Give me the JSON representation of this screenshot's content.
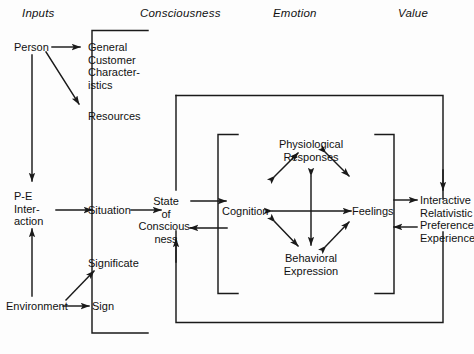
{
  "diagram": {
    "background_color": "#fdfdfd",
    "line_color": "#1a1a1a",
    "text_color": "#111111"
  },
  "columns": [
    {
      "id": "inputs",
      "label": "Inputs"
    },
    {
      "id": "consciousness",
      "label": "Consciousness"
    },
    {
      "id": "emotion",
      "label": "Emotion"
    },
    {
      "id": "value",
      "label": "Value"
    }
  ],
  "nodes": [
    {
      "id": "person",
      "label": "Person",
      "column": "inputs"
    },
    {
      "id": "general-customer-characteristics",
      "label": "General\nCustomer\nCharacter-\nistics",
      "column": "inputs"
    },
    {
      "id": "resources",
      "label": "Resources",
      "column": "inputs"
    },
    {
      "id": "pe-interaction",
      "label": "P-E\nInter-\naction",
      "column": "inputs"
    },
    {
      "id": "situation",
      "label": "Situation",
      "column": "inputs"
    },
    {
      "id": "significate",
      "label": "Significate",
      "column": "inputs"
    },
    {
      "id": "environment",
      "label": "Environment",
      "column": "inputs"
    },
    {
      "id": "sign",
      "label": "Sign",
      "column": "inputs"
    },
    {
      "id": "state-of-consciousness",
      "label": "State\nof\nConscious-\nness",
      "column": "consciousness"
    },
    {
      "id": "cognition",
      "label": "Cognition",
      "column": "emotion"
    },
    {
      "id": "physiological-responses",
      "label": "Physiological\nResponses",
      "column": "emotion"
    },
    {
      "id": "behavioral-expression",
      "label": "Behavioral\nExpression",
      "column": "emotion"
    },
    {
      "id": "feelings",
      "label": "Feelings",
      "column": "emotion"
    },
    {
      "id": "interactive-relativistic-preference-experience",
      "label": "Interactive\nRelativistic\nPreference\nExperience",
      "column": "value"
    }
  ],
  "node_text": {
    "person": "Person",
    "gcc_line1": "General",
    "gcc_line2": "Customer",
    "gcc_line3": "Character-",
    "gcc_line4": "istics",
    "resources": "Resources",
    "pe_line1": "P-E",
    "pe_line2": "Inter-",
    "pe_line3": "action",
    "situation": "Situation",
    "significate": "Significate",
    "environment": "Environment",
    "sign": "Sign",
    "soc_line1": "State",
    "soc_line2": "of",
    "soc_line3": "Conscious-",
    "soc_line4": "ness",
    "cognition": "Cognition",
    "phys_line1": "Physiological",
    "phys_line2": "Responses",
    "behav_line1": "Behavioral",
    "behav_line2": "Expression",
    "feelings": "Feelings",
    "value_line1": "Interactive",
    "value_line2": "Relativistic",
    "value_line3": "Preference",
    "value_line4": "Experience"
  },
  "edges": [
    {
      "id": "person-to-gcc",
      "from": "person",
      "to": "general-customer-characteristics",
      "arrow": "single"
    },
    {
      "id": "person-to-resources",
      "from": "person",
      "to": "resources",
      "arrow": "single"
    },
    {
      "id": "person-to-pe",
      "from": "person",
      "to": "pe-interaction",
      "arrow": "single"
    },
    {
      "id": "environment-to-pe",
      "from": "environment",
      "to": "pe-interaction",
      "arrow": "single"
    },
    {
      "id": "pe-to-situation",
      "from": "pe-interaction",
      "to": "situation",
      "arrow": "single"
    },
    {
      "id": "environment-to-sign",
      "from": "environment",
      "to": "sign",
      "arrow": "single"
    },
    {
      "id": "sign-to-significate",
      "from": "sign",
      "to": "significate",
      "arrow": "single"
    },
    {
      "id": "situation-to-soc",
      "from": "situation",
      "to": "state-of-consciousness",
      "arrow": "single"
    },
    {
      "id": "soc-to-cognition",
      "from": "state-of-consciousness",
      "to": "cognition",
      "arrow": "single"
    },
    {
      "id": "cognition-to-soc",
      "from": "cognition",
      "to": "state-of-consciousness",
      "arrow": "single"
    },
    {
      "id": "cognition-physiological",
      "from": "cognition",
      "to": "physiological-responses",
      "arrow": "double"
    },
    {
      "id": "cognition-behavioral",
      "from": "cognition",
      "to": "behavioral-expression",
      "arrow": "double"
    },
    {
      "id": "cognition-feelings",
      "from": "cognition",
      "to": "feelings",
      "arrow": "double"
    },
    {
      "id": "physiological-behavioral",
      "from": "physiological-responses",
      "to": "behavioral-expression",
      "arrow": "double"
    },
    {
      "id": "physiological-feelings",
      "from": "physiological-responses",
      "to": "feelings",
      "arrow": "double"
    },
    {
      "id": "behavioral-feelings",
      "from": "behavioral-expression",
      "to": "feelings",
      "arrow": "double"
    },
    {
      "id": "feelings-to-value",
      "from": "feelings",
      "to": "interactive-relativistic-preference-experience",
      "arrow": "single"
    },
    {
      "id": "value-to-feelings",
      "from": "interactive-relativistic-preference-experience",
      "to": "feelings",
      "arrow": "single"
    },
    {
      "id": "consciousness-frame-to-value",
      "from": "consciousness-frame",
      "to": "interactive-relativistic-preference-experience",
      "arrow": "single"
    },
    {
      "id": "value-feedback-to-soc",
      "from": "interactive-relativistic-preference-experience",
      "to": "state-of-consciousness",
      "arrow": "single"
    }
  ],
  "frames": [
    {
      "id": "inputs-bracket",
      "kind": "bracket-right"
    },
    {
      "id": "outer-value-loop",
      "kind": "rectangle"
    },
    {
      "id": "cognition-bracket",
      "kind": "bracket-right"
    },
    {
      "id": "feelings-bracket",
      "kind": "bracket-left"
    }
  ]
}
